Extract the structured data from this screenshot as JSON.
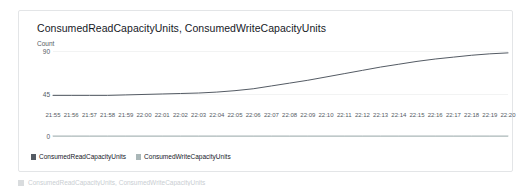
{
  "widget": {
    "title": "ConsumedReadCapacityUnits, ConsumedWriteCapacityUnits"
  },
  "colors": {
    "read_series": "#545b64",
    "write_series": "#aab7b8",
    "axis": "#d5dbdb",
    "grid": "#f2f3f3",
    "text": "#16191f",
    "muted_text": "#545b64",
    "card_border": "#e3e5e7"
  },
  "legend": {
    "items": [
      {
        "label": "ConsumedReadCapacityUnits",
        "color": "#545b64"
      },
      {
        "label": "ConsumedWriteCapacityUnits",
        "color": "#aab7b8"
      }
    ]
  },
  "below_strip": {
    "label": "ConsumedReadCapacityUnits, ConsumedWriteCapacityUnits"
  },
  "chart_data": {
    "type": "line",
    "title": "ConsumedReadCapacityUnits, ConsumedWriteCapacityUnits",
    "xlabel": "",
    "ylabel": "Count",
    "ylim": [
      0,
      90
    ],
    "yticks": [
      0,
      45,
      90
    ],
    "ytick_labels": [
      "0",
      "45",
      "90"
    ],
    "grid": true,
    "legend_position": "bottom-left",
    "x": [
      "21:55",
      "21:56",
      "21:57",
      "21:58",
      "21:59",
      "22:00",
      "22:01",
      "22:02",
      "22:03",
      "22:04",
      "22:05",
      "22:06",
      "22:07",
      "22:08",
      "22:09",
      "22:10",
      "22:11",
      "22:12",
      "22:13",
      "22:14",
      "22:15",
      "22:16",
      "22:17",
      "22:18",
      "22:19",
      "22:20"
    ],
    "series": [
      {
        "name": "ConsumedReadCapacityUnits",
        "color": "#545b64",
        "values": [
          43,
          43,
          43,
          43,
          43.5,
          44,
          44.5,
          45,
          45.5,
          46.5,
          48,
          50,
          53,
          56,
          59,
          62.5,
          66,
          69.5,
          73,
          76,
          79,
          81.5,
          83.5,
          85.5,
          87,
          88
        ]
      },
      {
        "name": "ConsumedWriteCapacityUnits",
        "color": "#aab7b8",
        "values": [
          0,
          0,
          0,
          0,
          0,
          0,
          0,
          0,
          0,
          0,
          0,
          0,
          0,
          0,
          0,
          0,
          0,
          0,
          0,
          0,
          0,
          0,
          0,
          0,
          0,
          0
        ]
      }
    ]
  }
}
